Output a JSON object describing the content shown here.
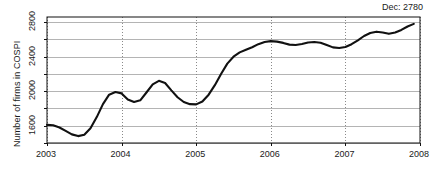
{
  "chart_data": {
    "type": "line",
    "title": "",
    "xlabel": "",
    "ylabel": "Number of firms in COSPI",
    "xlim": [
      2003.0,
      2008.0
    ],
    "ylim": [
      1400,
      2860
    ],
    "grid": true,
    "legend": null,
    "annotations": [
      {
        "name": "last-value-label",
        "text": "Dec: 2780",
        "position": "top-right"
      }
    ],
    "x_tick_labels": [
      "2003",
      "2004",
      "2005",
      "2006",
      "2007",
      "2008"
    ],
    "x_tick_values": [
      2003,
      2004,
      2005,
      2006,
      2007,
      2008
    ],
    "y_tick_labels": [
      "1600",
      "2000",
      "2400",
      "2800"
    ],
    "y_tick_values": [
      1600,
      2000,
      2400,
      2800
    ],
    "y_gridline_values": [
      1400,
      1600,
      1800,
      2000,
      2200,
      2400,
      2600,
      2800
    ],
    "y_minor_tick_values": [
      1400,
      1800,
      2200,
      2600
    ],
    "line_color": "#111111",
    "grid_color": "#b4b4b4",
    "series": [
      {
        "name": "Number of firms in COSPI",
        "x": [
          2003.0,
          2003.083,
          2003.167,
          2003.25,
          2003.333,
          2003.417,
          2003.5,
          2003.583,
          2003.667,
          2003.75,
          2003.833,
          2003.917,
          2004.0,
          2004.083,
          2004.167,
          2004.25,
          2004.333,
          2004.417,
          2004.5,
          2004.583,
          2004.667,
          2004.75,
          2004.833,
          2004.917,
          2005.0,
          2005.083,
          2005.167,
          2005.25,
          2005.333,
          2005.417,
          2005.5,
          2005.583,
          2005.667,
          2005.75,
          2005.833,
          2005.917,
          2006.0,
          2006.083,
          2006.167,
          2006.25,
          2006.333,
          2006.417,
          2006.5,
          2006.583,
          2006.667,
          2006.75,
          2006.833,
          2006.917,
          2007.0,
          2007.083,
          2007.167,
          2007.25,
          2007.333,
          2007.417,
          2007.5,
          2007.583,
          2007.667,
          2007.75,
          2007.833,
          2007.917
        ],
        "values": [
          1610,
          1605,
          1580,
          1540,
          1500,
          1480,
          1495,
          1570,
          1700,
          1850,
          1960,
          1990,
          1975,
          1905,
          1875,
          1895,
          1985,
          2080,
          2120,
          2095,
          2010,
          1930,
          1875,
          1850,
          1848,
          1880,
          1960,
          2070,
          2200,
          2320,
          2400,
          2450,
          2480,
          2510,
          2545,
          2570,
          2580,
          2575,
          2560,
          2540,
          2535,
          2548,
          2565,
          2570,
          2562,
          2535,
          2508,
          2500,
          2512,
          2545,
          2590,
          2640,
          2675,
          2690,
          2680,
          2665,
          2680,
          2710,
          2750,
          2780
        ]
      }
    ]
  },
  "axis_title_text": "Number of firms in COSPI"
}
